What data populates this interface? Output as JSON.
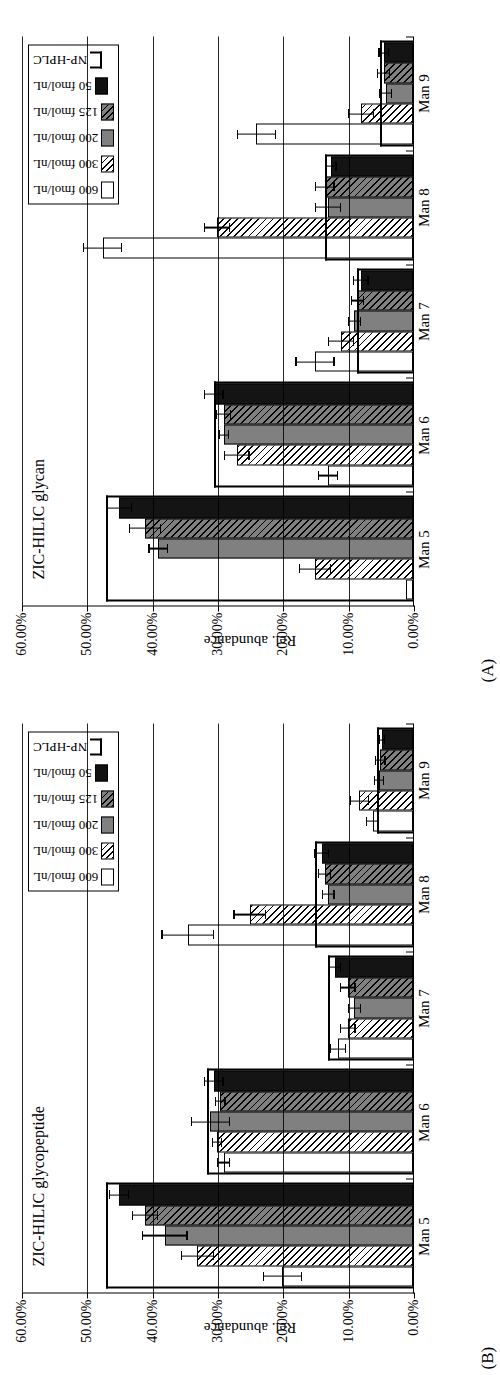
{
  "figure": {
    "orientation": "rotated-90-ccw",
    "ylabel": "Rel. abundance",
    "yticks": [
      "60.00%",
      "50.00%",
      "40.00%",
      "30.00%",
      "20.00%",
      "10.00%",
      "0.00%"
    ],
    "ylim": [
      0,
      60
    ],
    "categories": [
      "Man 5",
      "Man 6",
      "Man 7",
      "Man 8",
      "Man 9"
    ],
    "legend": {
      "items": [
        {
          "label": "600 fmol/nL",
          "swatch": "white-open",
          "key": "sw-600"
        },
        {
          "label": "300 fmol/nL",
          "swatch": "white-hatched",
          "key": "sw-300"
        },
        {
          "label": "200 fmol/nL",
          "swatch": "gray-solid",
          "key": "sw-200"
        },
        {
          "label": "125 fmol/nL",
          "swatch": "gray-hatched",
          "key": "sw-125"
        },
        {
          "label": "50 fmol/nL",
          "swatch": "black-solid",
          "key": "sw-50"
        },
        {
          "label": "NP-HPLC",
          "swatch": "open-bracket",
          "key": "sw-np"
        }
      ]
    },
    "panels": [
      {
        "tag": "(B)",
        "title": "ZIC-HILIC glycopeptide"
      },
      {
        "tag": "(A)",
        "title": "ZIC-HILIC glycan"
      }
    ]
  },
  "chart_data": [
    {
      "type": "bar",
      "panel": "B",
      "title": "ZIC-HILIC glycopeptide",
      "xlabel": "",
      "ylabel": "Rel. abundance",
      "ylim": [
        0,
        60
      ],
      "ytick_values": [
        60,
        50,
        40,
        30,
        20,
        10,
        0
      ],
      "grid": true,
      "legend_position": "top-right",
      "categories": [
        "Man 5",
        "Man 6",
        "Man 7",
        "Man 8",
        "Man 9"
      ],
      "series": [
        {
          "name": "600 fmol/nL",
          "values": [
            20.0,
            29.0,
            11.5,
            34.5,
            6.2
          ],
          "errors": [
            3.0,
            1.0,
            1.2,
            4.0,
            1.0
          ]
        },
        {
          "name": "300 fmol/nL",
          "values": [
            33.0,
            30.0,
            10.0,
            25.0,
            8.2
          ],
          "errors": [
            2.5,
            0.8,
            1.2,
            2.5,
            1.5
          ]
        },
        {
          "name": "200 fmol/nL",
          "values": [
            38.0,
            31.0,
            9.0,
            13.0,
            5.2
          ],
          "errors": [
            3.5,
            3.0,
            1.0,
            1.0,
            0.8
          ]
        },
        {
          "name": "125 fmol/nL",
          "values": [
            41.0,
            29.5,
            10.0,
            13.5,
            5.0
          ],
          "errors": [
            2.0,
            0.8,
            1.2,
            1.0,
            0.8
          ]
        },
        {
          "name": "50 fmol/nL",
          "values": [
            45.0,
            30.5,
            12.0,
            14.0,
            4.8
          ],
          "errors": [
            1.5,
            1.5,
            1.0,
            1.2,
            0.5
          ]
        },
        {
          "name": "NP-HPLC",
          "values": [
            47.0,
            31.5,
            13.0,
            15.0,
            5.5
          ],
          "errors": [
            0,
            0,
            0,
            0,
            0
          ],
          "render": "open-bracket"
        }
      ]
    },
    {
      "type": "bar",
      "panel": "A",
      "title": "ZIC-HILIC glycan",
      "xlabel": "",
      "ylabel": "Rel. abundance",
      "ylim": [
        0,
        60
      ],
      "ytick_values": [
        60,
        50,
        40,
        30,
        20,
        10,
        0
      ],
      "grid": true,
      "legend_position": "top-right",
      "categories": [
        "Man 5",
        "Man 6",
        "Man 7",
        "Man 8",
        "Man 9"
      ],
      "series": [
        {
          "name": "600 fmol/nL",
          "values": [
            1.0,
            13.0,
            15.0,
            47.5,
            24.0
          ],
          "errors": [
            0.0,
            1.5,
            3.0,
            3.0,
            3.0
          ]
        },
        {
          "name": "300 fmol/nL",
          "values": [
            15.0,
            27.0,
            11.0,
            30.0,
            8.0
          ],
          "errors": [
            2.5,
            2.0,
            2.0,
            2.0,
            2.0
          ]
        },
        {
          "name": "200 fmol/nL",
          "values": [
            39.0,
            29.0,
            9.0,
            13.0,
            4.2
          ],
          "errors": [
            1.5,
            0.8,
            1.0,
            2.0,
            1.0
          ]
        },
        {
          "name": "125 fmol/nL",
          "values": [
            41.0,
            29.0,
            8.5,
            13.5,
            4.5
          ],
          "errors": [
            2.5,
            1.2,
            1.0,
            1.5,
            1.0
          ]
        },
        {
          "name": "50 fmol/nL",
          "values": [
            45.0,
            30.5,
            8.0,
            12.5,
            4.5
          ],
          "errors": [
            2.0,
            1.5,
            1.2,
            0.8,
            0.8
          ]
        },
        {
          "name": "NP-HPLC",
          "values": [
            47.0,
            30.5,
            8.5,
            13.5,
            5.0
          ],
          "errors": [
            0,
            0,
            0,
            0,
            0
          ],
          "render": "open-bracket"
        }
      ]
    }
  ]
}
